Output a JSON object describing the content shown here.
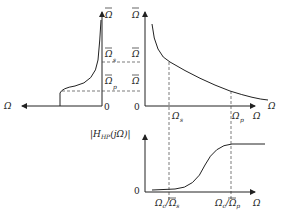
{
  "diagram": {
    "labels": {
      "omega_bar": "Ω",
      "omega": "Ω",
      "omega_bar_s": "Ω",
      "omega_bar_p": "Ω",
      "sub_s": "s",
      "sub_p": "p",
      "zero": "0",
      "H_prefix": "|H",
      "H_sub": "HP",
      "H_suffix": "(jΩ)|",
      "omega_s": "Ω",
      "omega_p": "Ω",
      "omega_c_over_s": "Ω",
      "c_sub": "c",
      "slash": "/"
    },
    "panels": [
      {
        "name": "lowpass-prototype-magnitude",
        "x_axis": "Ω (leftward)",
        "y_axis": "Ω̄"
      },
      {
        "name": "mapping-curve",
        "x_axis": "Ω",
        "y_axis": "Ω̄",
        "marks": [
          "Ω̄s",
          "Ω̄p",
          "Ωs",
          "Ωp"
        ]
      },
      {
        "name": "highpass-magnitude",
        "x_axis": "Ω",
        "y_axis": "|H_HP(jΩ)|",
        "marks": [
          "Ωc/Ω̄s",
          "Ωc/Ω̄p"
        ]
      }
    ]
  }
}
